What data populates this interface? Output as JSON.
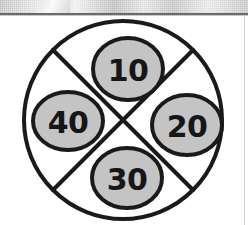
{
  "page": {
    "background_color": "#ffffff"
  },
  "top_band": {
    "name": "scan-artifact-band",
    "description": "gray halftone scan texture strip",
    "color": "#e4e4e4"
  },
  "diagram": {
    "outline_color": "#1a1a1a",
    "fill_color": "#c4c4c4",
    "label_color": "#161616",
    "outer_circle": {
      "cx": 123,
      "cy": 120,
      "r": 99
    },
    "divider_lines": [
      {
        "name": "divider-nw-se",
        "x1": 53,
        "y1": 50,
        "x2": 193,
        "y2": 190
      },
      {
        "name": "divider-ne-sw",
        "x1": 193,
        "y1": 50,
        "x2": 53,
        "y2": 190
      }
    ],
    "sectors": [
      {
        "id": "top",
        "label": "10",
        "cx": 128,
        "cy": 69,
        "rx": 35,
        "ry": 31
      },
      {
        "id": "right",
        "label": "20",
        "cx": 187,
        "cy": 125,
        "rx": 35,
        "ry": 30
      },
      {
        "id": "bottom",
        "label": "30",
        "cx": 127,
        "cy": 178,
        "rx": 35,
        "ry": 30
      },
      {
        "id": "left",
        "label": "40",
        "cx": 68,
        "cy": 121,
        "rx": 35,
        "ry": 29
      }
    ]
  }
}
